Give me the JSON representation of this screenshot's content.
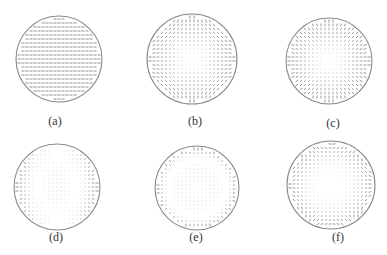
{
  "figure": {
    "panels": [
      {
        "id": "a",
        "label": "(a)",
        "cx": 59,
        "cy": 59,
        "r": 43,
        "pattern": "tilt",
        "label_x": 55,
        "label_y": 115
      },
      {
        "id": "b",
        "label": "(b)",
        "cx": 192,
        "cy": 59,
        "r": 45,
        "pattern": "astigmatism",
        "label_x": 195,
        "label_y": 115
      },
      {
        "id": "c",
        "label": "(c)",
        "cx": 329,
        "cy": 61,
        "r": 43,
        "pattern": "defocus",
        "label_x": 333,
        "label_y": 117
      },
      {
        "id": "d",
        "label": "(d)",
        "cx": 57,
        "cy": 187,
        "r": 43,
        "pattern": "coma",
        "label_x": 56,
        "label_y": 231
      },
      {
        "id": "e",
        "label": "(e)",
        "cx": 197,
        "cy": 188,
        "r": 42,
        "pattern": "spherical",
        "label_x": 196,
        "label_y": 231
      },
      {
        "id": "f",
        "label": "(f)",
        "cx": 331,
        "cy": 185,
        "r": 44,
        "pattern": "trefoil",
        "label_x": 338,
        "label_y": 231
      }
    ],
    "colors": {
      "circle_stroke": "#8a8a8a",
      "arrow": "#7a7a7a",
      "label": "#333333",
      "background": "#ffffff"
    },
    "grid_spacing": 4
  }
}
